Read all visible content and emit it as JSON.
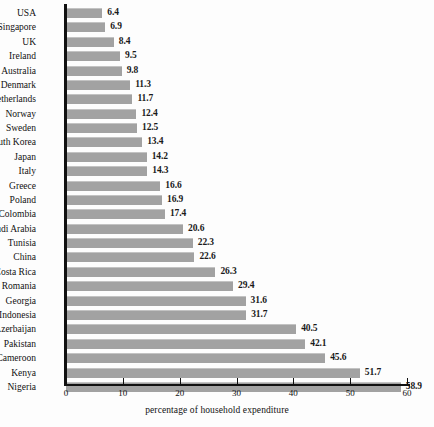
{
  "chart_data": {
    "type": "bar",
    "orientation": "horizontal",
    "title": "",
    "xlabel": "percentage of household expenditure",
    "ylabel": "",
    "xlim": [
      0,
      60
    ],
    "xticks": [
      0,
      10,
      20,
      30,
      40,
      50,
      60
    ],
    "grid": false,
    "legend": null,
    "bar_color": "#a2a2a2",
    "categories": [
      "USA",
      "Singapore",
      "UK",
      "Ireland",
      "Australia",
      "Denmark",
      "Netherlands",
      "Norway",
      "Sweden",
      "South Korea",
      "Japan",
      "Italy",
      "Greece",
      "Poland",
      "Colombia",
      "Saudi Arabia",
      "Tunisia",
      "China",
      "Costa Rica",
      "Romania",
      "Georgia",
      "Indonesia",
      "Azerbaijan",
      "Pakistan",
      "Cameroon",
      "Kenya",
      "Nigeria"
    ],
    "values": [
      6.4,
      6.9,
      8.4,
      9.5,
      9.8,
      11.3,
      11.7,
      12.4,
      12.5,
      13.4,
      14.2,
      14.3,
      16.6,
      16.9,
      17.4,
      20.6,
      22.3,
      22.6,
      26.3,
      29.4,
      31.6,
      31.7,
      40.5,
      42.1,
      45.6,
      51.7,
      58.9
    ],
    "value_labels": [
      "6.4",
      "6.9",
      "8.4",
      "9.5",
      "9.8",
      "11.3",
      "11.7",
      "12.4",
      "12.5",
      "13.4",
      "14.2",
      "14.3",
      "16.6",
      "16.9",
      "17.4",
      "20.6",
      "22.3",
      "22.6",
      "26.3",
      "29.4",
      "31.6",
      "31.7",
      "40.5",
      "42.1",
      "45.6",
      "51.7",
      "58.9"
    ],
    "xtick_labels": [
      "0",
      "10",
      "20",
      "30",
      "40",
      "50",
      "60"
    ]
  }
}
